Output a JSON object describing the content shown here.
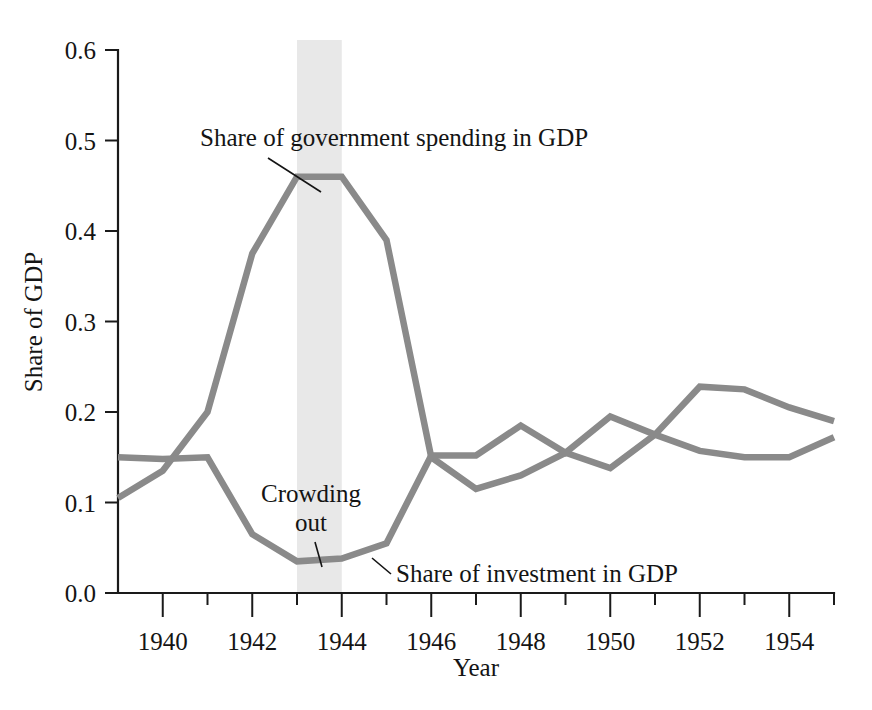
{
  "chart_data": {
    "type": "line",
    "title": "",
    "xlabel": "Year",
    "ylabel": "Share of GDP",
    "x": [
      1939,
      1940,
      1941,
      1942,
      1943,
      1944,
      1945,
      1946,
      1947,
      1948,
      1949,
      1950,
      1951,
      1952,
      1953,
      1954,
      1955
    ],
    "xlim": [
      1939,
      1955
    ],
    "ylim": [
      0.0,
      0.6
    ],
    "grid": false,
    "legend_position": "none",
    "x_tick_labels": [
      "1940",
      "1942",
      "1944",
      "1946",
      "1948",
      "1950",
      "1952",
      "1954"
    ],
    "x_tick_values": [
      1940,
      1942,
      1944,
      1946,
      1948,
      1950,
      1952,
      1954
    ],
    "x_minor_tick_values": [
      1941,
      1943,
      1945,
      1947,
      1949,
      1951,
      1953,
      1955
    ],
    "y_tick_labels": [
      "0.0",
      "0.1",
      "0.2",
      "0.3",
      "0.4",
      "0.5",
      "0.6"
    ],
    "y_tick_values": [
      0.0,
      0.1,
      0.2,
      0.3,
      0.4,
      0.5,
      0.6
    ],
    "series": [
      {
        "name": "Share of government spending in GDP",
        "color": "#8a8a8a",
        "values": [
          0.105,
          0.135,
          0.2,
          0.375,
          0.46,
          0.46,
          0.39,
          0.15,
          0.115,
          0.13,
          0.155,
          0.138,
          0.175,
          0.228,
          0.225,
          0.205,
          0.19
        ]
      },
      {
        "name": "Share of investment in GDP",
        "color": "#8a8a8a",
        "values": [
          0.15,
          0.148,
          0.15,
          0.065,
          0.035,
          0.038,
          0.055,
          0.152,
          0.152,
          0.185,
          0.155,
          0.195,
          0.175,
          0.157,
          0.15,
          0.15,
          0.172
        ]
      }
    ],
    "annotations": [
      {
        "id": "gov-label",
        "text": "Share of government spending in GDP",
        "text_x": 200,
        "text_y": 146,
        "leader": [
          268,
          158,
          320,
          190
        ]
      },
      {
        "id": "crowding-out-label",
        "line1": "Crowding",
        "line2": "out",
        "text_x": 255,
        "text_y": 500,
        "text_y2": 528,
        "leader": [
          312,
          540,
          320,
          566
        ]
      },
      {
        "id": "inv-label",
        "text": "Share of investment in GDP",
        "text_x": 395,
        "text_y": 580,
        "leader": [
          371,
          556,
          390,
          572
        ]
      }
    ],
    "shaded_region": {
      "label": "crowding-out-band",
      "x_start": 1943,
      "x_end": 1944,
      "color": "#e8e8e8"
    }
  }
}
